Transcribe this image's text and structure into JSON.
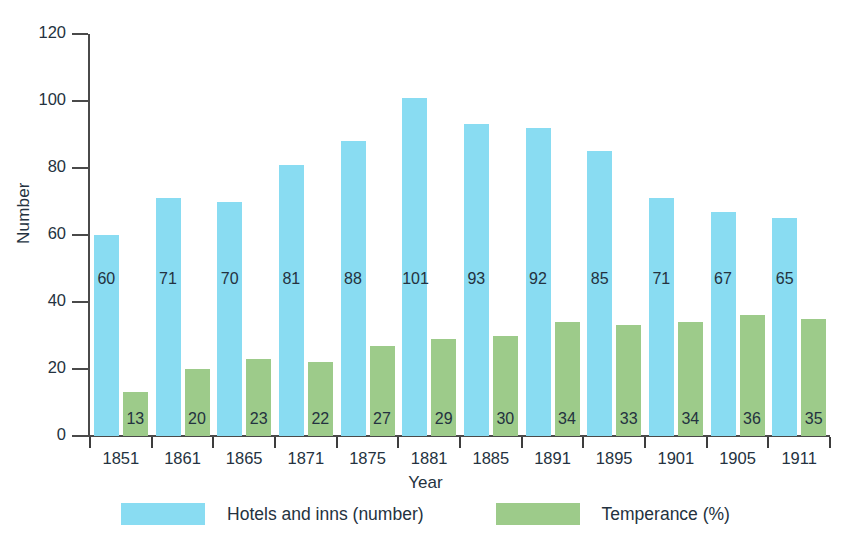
{
  "chart_data": {
    "type": "bar",
    "title": "",
    "xlabel": "Year",
    "ylabel": "Number",
    "ylim": [
      0,
      120
    ],
    "yticks": [
      0,
      20,
      40,
      60,
      80,
      100,
      120
    ],
    "grid": false,
    "legend_position": "bottom-center",
    "categories": [
      "1851",
      "1861",
      "1865",
      "1871",
      "1875",
      "1881",
      "1885",
      "1891",
      "1895",
      "1901",
      "1905",
      "1911"
    ],
    "series": [
      {
        "name": "Hotels and inns (number)",
        "color": "#89dcf2",
        "values": [
          60,
          71,
          70,
          81,
          88,
          101,
          93,
          92,
          85,
          71,
          67,
          65
        ]
      },
      {
        "name": "Temperance (%)",
        "color": "#9dcb8a",
        "values": [
          13,
          20,
          23,
          22,
          27,
          29,
          30,
          34,
          33,
          34,
          36,
          35
        ]
      }
    ]
  },
  "axes": {
    "y_label": "Number",
    "x_label": "Year",
    "y_tick_labels": [
      "0",
      "20",
      "40",
      "60",
      "80",
      "100",
      "120"
    ],
    "x_tick_labels": [
      "1851",
      "1861",
      "1865",
      "1871",
      "1875",
      "1881",
      "1885",
      "1891",
      "1895",
      "1901",
      "1905",
      "1911"
    ],
    "axis_color": "#4a4a4a"
  },
  "legend": {
    "items": [
      {
        "label": "Hotels and inns (number)",
        "color": "#89dcf2"
      },
      {
        "label": "Temperance (%)",
        "color": "#9dcb8a"
      }
    ]
  },
  "bar_labels": {
    "blue": [
      "60",
      "71",
      "70",
      "81",
      "88",
      "101",
      "93",
      "92",
      "85",
      "71",
      "67",
      "65"
    ],
    "green": [
      "13",
      "20",
      "23",
      "22",
      "27",
      "29",
      "30",
      "34",
      "33",
      "34",
      "36",
      "35"
    ]
  }
}
